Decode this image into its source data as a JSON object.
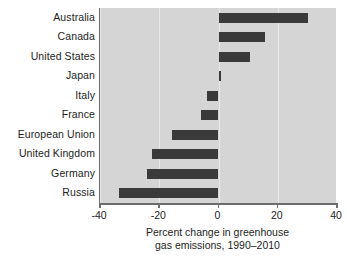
{
  "chart_data": {
    "type": "bar",
    "orientation": "horizontal",
    "title": "",
    "xlabel_lines": [
      "Percent change in greenhouse",
      "gas emissions, 1990–2010"
    ],
    "ylabel": "",
    "categories": [
      "Australia",
      "Canada",
      "United States",
      "Japan",
      "Italy",
      "France",
      "European Union",
      "United Kingdom",
      "Germany",
      "Russia"
    ],
    "values": [
      30.3,
      15.6,
      10.6,
      1.0,
      -4.0,
      -6.0,
      -15.6,
      -22.6,
      -24.3,
      -33.7
    ],
    "xlim": [
      -40,
      40
    ],
    "xticks": [
      -40,
      -20,
      0,
      20,
      40
    ],
    "xtick_labels": [
      "-40",
      "-20",
      "0",
      "20",
      "40"
    ],
    "grid": "vertical-light",
    "legend": "none",
    "bar_color": "#3a3a3a",
    "plot_background": "#d5d5d5",
    "axis_color": "#6d6d6d",
    "figure_background": "#ffffff"
  }
}
